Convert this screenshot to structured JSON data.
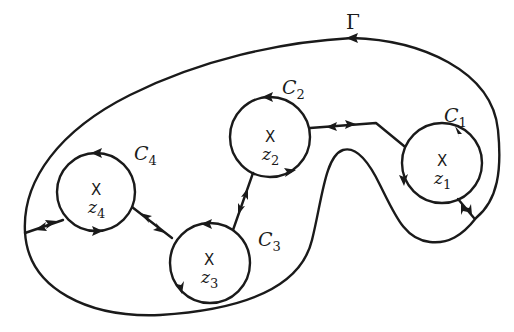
{
  "figure": {
    "outer_contour": {
      "label": "Γ",
      "orientation": "counterclockwise"
    },
    "circles": [
      {
        "id": "C1",
        "label": "C",
        "subscript": "1",
        "pole_marker": "X",
        "pole_label": "z",
        "pole_subscript": "1"
      },
      {
        "id": "C2",
        "label": "C",
        "subscript": "2",
        "pole_marker": "X",
        "pole_label": "z",
        "pole_subscript": "2"
      },
      {
        "id": "C3",
        "label": "C",
        "subscript": "3",
        "pole_marker": "X",
        "pole_label": "z",
        "pole_subscript": "3"
      },
      {
        "id": "C4",
        "label": "C",
        "subscript": "4",
        "pole_marker": "X",
        "pole_label": "z",
        "pole_subscript": "4"
      }
    ],
    "connections": [
      {
        "from": "Γ",
        "to": "C4",
        "arrows": "bidirectional"
      },
      {
        "from": "C4",
        "to": "C3",
        "arrows": "bidirectional"
      },
      {
        "from": "C3",
        "to": "C2",
        "arrows": "bidirectional"
      },
      {
        "from": "C2",
        "to": "C1",
        "arrows": "bidirectional"
      },
      {
        "from": "C1",
        "to": "Γ",
        "arrows": "bidirectional"
      }
    ],
    "colors": {
      "ink": "#1a1a1a",
      "background": "#ffffff"
    }
  }
}
